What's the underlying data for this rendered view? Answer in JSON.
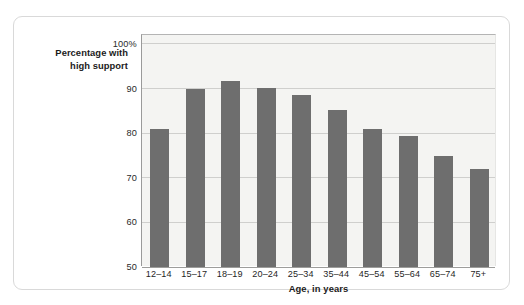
{
  "chart_data": {
    "type": "bar",
    "title": "",
    "subtitle": "",
    "xlabel": "Age, in years",
    "ylabel": "Percentage with high support",
    "ylabel_lines": [
      "Percentage with",
      "high support"
    ],
    "categories": [
      "12–14",
      "15–17",
      "18–19",
      "20–24",
      "25–34",
      "35–44",
      "45–54",
      "55–64",
      "65–74",
      "75+"
    ],
    "values": [
      81,
      90,
      91.8,
      90.2,
      88.5,
      85.2,
      81,
      79.3,
      74.8,
      72
    ],
    "ylim": [
      50,
      102
    ],
    "yticks": [
      50,
      60,
      70,
      80,
      90,
      100
    ],
    "ytick_labels": [
      "50",
      "60",
      "70",
      "80",
      "90",
      "100%"
    ],
    "grid": true,
    "legend": false,
    "legend_position": "none",
    "bar_color": "#6e6e6e",
    "plot_background": "#f4f4f2",
    "gridline_color": "#cfcfcd",
    "axis_color": "#9a9a9a",
    "card_border_color": "#d9d9d9"
  }
}
